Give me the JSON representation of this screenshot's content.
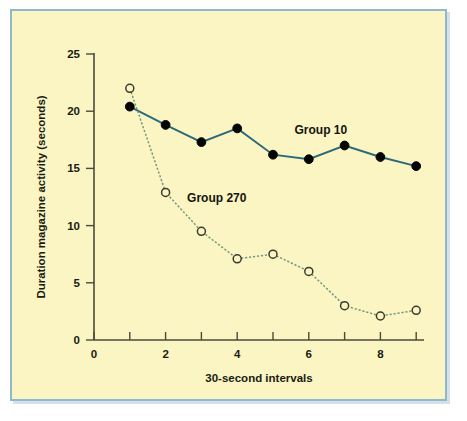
{
  "figure": {
    "background_color": "#faf5c3",
    "border_color": "#8fb8cc"
  },
  "chart_data": {
    "type": "line",
    "title": "",
    "xlabel": "30-second intervals",
    "ylabel": "Duration magazine activity (seconds)",
    "xlim": [
      0,
      9.6
    ],
    "ylim": [
      0,
      25
    ],
    "x": [
      1,
      2,
      3,
      4,
      5,
      6,
      7,
      8,
      9
    ],
    "xticks": [
      0,
      1,
      2,
      3,
      4,
      5,
      6,
      7,
      8,
      9
    ],
    "xtick_labels": [
      "0",
      "",
      "2",
      "",
      "4",
      "",
      "6",
      "",
      "8",
      ""
    ],
    "yticks": [
      0,
      5,
      10,
      15,
      20,
      25
    ],
    "ytick_labels": [
      "0",
      "5",
      "10",
      "15",
      "20",
      "25"
    ],
    "grid": false,
    "legend_position": "inline-annotation",
    "series": [
      {
        "name": "Group 10",
        "marker": "filled-circle",
        "line_style": "solid",
        "color": "#2b6a78",
        "values": [
          20.4,
          18.8,
          17.3,
          18.5,
          16.2,
          15.8,
          17.0,
          16.0,
          15.2
        ],
        "label_x": 5.6,
        "label_y": 18.0
      },
      {
        "name": "Group 270",
        "marker": "open-circle",
        "line_style": "dotted",
        "color": "#79997f",
        "values": [
          22.0,
          12.9,
          9.5,
          7.1,
          7.5,
          6.0,
          3.0,
          2.1,
          2.6
        ],
        "label_x": 2.6,
        "label_y": 12.1
      }
    ]
  }
}
